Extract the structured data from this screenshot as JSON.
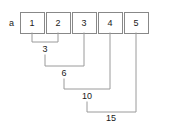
{
  "diagram": {
    "array_label": "a",
    "cells": [
      {
        "value": "1",
        "x": 20,
        "y": 12,
        "w": 24,
        "h": 21,
        "cx": 32
      },
      {
        "value": "2",
        "x": 46,
        "y": 12,
        "w": 24,
        "h": 21,
        "cx": 58
      },
      {
        "value": "3",
        "x": 72,
        "y": 12,
        "w": 24,
        "h": 21,
        "cx": 84
      },
      {
        "value": "4",
        "x": 98,
        "y": 12,
        "w": 24,
        "h": 21,
        "cx": 110
      },
      {
        "value": "5",
        "x": 124,
        "y": 12,
        "w": 24,
        "h": 21,
        "cx": 136
      }
    ],
    "brackets": [
      {
        "sum": "3",
        "path": "M 32 33 L 32 42 L 58 42 L 58 33",
        "label_x": 45,
        "label_y": 52,
        "from_cell": 0,
        "to_cell": 1
      },
      {
        "sum": "6",
        "path": "M 45 55 L 45 66 L 84 66 L 84 33",
        "label_x": 64,
        "label_y": 76,
        "from_cell": 1,
        "to_cell": 2
      },
      {
        "sum": "10",
        "path": "M 64 79 L 64 89 L 110 89 L 110 33",
        "label_x": 87,
        "label_y": 99,
        "from_cell": 2,
        "to_cell": 3
      },
      {
        "sum": "15",
        "path": "M 87 102 L 87 112 L 136 112 L 136 33",
        "label_x": 111,
        "label_y": 121,
        "from_cell": 3,
        "to_cell": 4
      }
    ],
    "colors": {
      "background": "#ffffff",
      "box_stroke": "#888888",
      "bracket_stroke": "#9a9a9a",
      "text": "#1a1a1a"
    }
  }
}
